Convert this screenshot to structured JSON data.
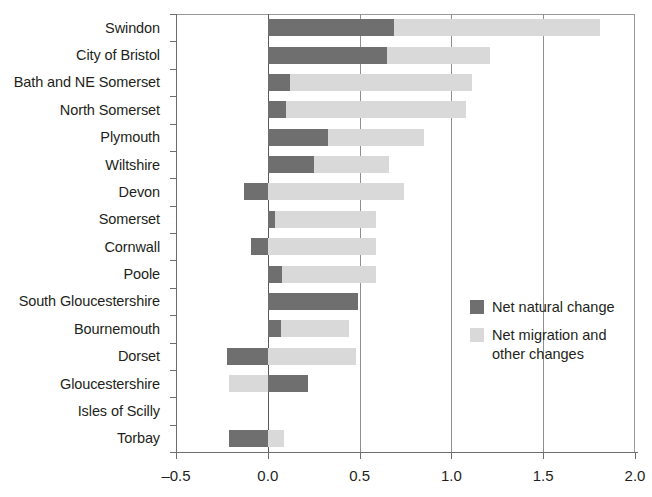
{
  "chart_data": {
    "type": "bar",
    "orientation": "horizontal",
    "stacked": true,
    "title": "",
    "subtitle": "",
    "xlabel": "",
    "ylabel": "",
    "xlim": [
      -0.5,
      2.0
    ],
    "xticks": [
      -0.5,
      0.0,
      0.5,
      1.0,
      1.5,
      2.0
    ],
    "xtick_labels": [
      "–0.5",
      "0.0",
      "0.5",
      "1.0",
      "1.5",
      "2.0"
    ],
    "grid": "vertical gridlines at 0.0, 0.5, 1.0, 1.5",
    "legend_position": "inside-right",
    "categories": [
      "Swindon",
      "City of Bristol",
      "Bath and NE Somerset",
      "North Somerset",
      "Plymouth",
      "Wiltshire",
      "Devon",
      "Somerset",
      "Cornwall",
      "Poole",
      "South Gloucestershire",
      "Bournemouth",
      "Dorset",
      "Gloucestershire",
      "Isles of Scilly",
      "Torbay"
    ],
    "series": [
      {
        "name": "Net natural change",
        "color": "#6f6f6f",
        "values": [
          0.69,
          0.65,
          0.12,
          0.1,
          0.33,
          0.25,
          -0.13,
          0.04,
          -0.09,
          0.08,
          0.49,
          0.07,
          -0.22,
          0.22,
          0.0,
          -0.21
        ]
      },
      {
        "name": "Net migration and other changes",
        "color": "#d9d9d9",
        "values": [
          1.12,
          0.56,
          0.99,
          0.98,
          0.52,
          0.41,
          0.87,
          0.55,
          0.68,
          0.51,
          0.0,
          0.37,
          0.7,
          -0.21,
          0.0,
          0.3
        ]
      }
    ],
    "totals": [
      1.81,
      1.21,
      1.11,
      1.08,
      0.85,
      0.66,
      0.74,
      0.59,
      0.59,
      0.59,
      0.49,
      0.44,
      0.48,
      0.01,
      0.0,
      0.09
    ],
    "bar_segments": [
      {
        "category": "Swindon",
        "dark_from": 0.0,
        "dark_to": 0.69,
        "light_from": 0.69,
        "light_to": 1.81
      },
      {
        "category": "City of Bristol",
        "dark_from": 0.0,
        "dark_to": 0.65,
        "light_from": 0.65,
        "light_to": 1.21
      },
      {
        "category": "Bath and NE Somerset",
        "dark_from": 0.0,
        "dark_to": 0.12,
        "light_from": 0.12,
        "light_to": 1.11
      },
      {
        "category": "North Somerset",
        "dark_from": 0.0,
        "dark_to": 0.1,
        "light_from": 0.1,
        "light_to": 1.08
      },
      {
        "category": "Plymouth",
        "dark_from": 0.0,
        "dark_to": 0.33,
        "light_from": 0.33,
        "light_to": 0.85
      },
      {
        "category": "Wiltshire",
        "dark_from": 0.0,
        "dark_to": 0.25,
        "light_from": 0.25,
        "light_to": 0.66
      },
      {
        "category": "Devon",
        "dark_from": -0.13,
        "dark_to": 0.0,
        "light_from": 0.0,
        "light_to": 0.74
      },
      {
        "category": "Somerset",
        "dark_from": 0.0,
        "dark_to": 0.04,
        "light_from": 0.04,
        "light_to": 0.59
      },
      {
        "category": "Cornwall",
        "dark_from": -0.09,
        "dark_to": 0.0,
        "light_from": 0.0,
        "light_to": 0.59
      },
      {
        "category": "Poole",
        "dark_from": 0.0,
        "dark_to": 0.08,
        "light_from": 0.08,
        "light_to": 0.59
      },
      {
        "category": "South Gloucestershire",
        "dark_from": 0.0,
        "dark_to": 0.49,
        "light_from": 0.49,
        "light_to": 0.49
      },
      {
        "category": "Bournemouth",
        "dark_from": 0.0,
        "dark_to": 0.07,
        "light_from": 0.07,
        "light_to": 0.44
      },
      {
        "category": "Dorset",
        "dark_from": -0.22,
        "dark_to": 0.0,
        "light_from": 0.0,
        "light_to": 0.48
      },
      {
        "category": "Gloucestershire",
        "dark_from": 0.0,
        "dark_to": 0.22,
        "light_from": -0.21,
        "light_to": 0.0
      },
      {
        "category": "Isles of Scilly",
        "dark_from": 0.0,
        "dark_to": 0.0,
        "light_from": 0.0,
        "light_to": 0.0
      },
      {
        "category": "Torbay",
        "dark_from": -0.21,
        "dark_to": 0.0,
        "light_from": 0.0,
        "light_to": 0.09
      }
    ]
  },
  "legend": {
    "items": [
      {
        "label": "Net natural change",
        "color": "#6f6f6f"
      },
      {
        "label": "Net migration and other changes",
        "color": "#d9d9d9"
      }
    ]
  },
  "colors": {
    "dark": "#6f6f6f",
    "light": "#d9d9d9",
    "axis": "#6d6d6d",
    "grid": "#8e8e8e",
    "text": "#231f20"
  }
}
